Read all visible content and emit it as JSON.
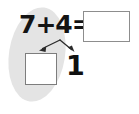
{
  "page": {
    "background_color": "#ffffff"
  },
  "highlight": {
    "name": "gray-oval-highlight",
    "color": "#e4e4e4",
    "shape": "ellipse",
    "rotation_degrees": 9
  },
  "problem": {
    "equation_text": "7+4=",
    "first_addend": "7",
    "operator": "+",
    "second_addend": "4",
    "equals": "=",
    "answer_box_value": "",
    "answer_box_border_color": "#8d8d8d"
  },
  "decomposition": {
    "tens_box_value": "",
    "tens_box_border_color": "#7d7d7d",
    "ones_digit": "1",
    "arrow_color": "#2b2b2b",
    "arrow_count": 2,
    "left_arrow_label": "arrow-to-tens-box",
    "right_arrow_label": "arrow-to-ones-digit"
  }
}
